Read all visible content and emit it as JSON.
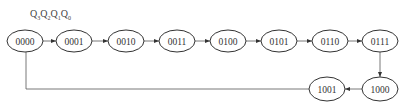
{
  "header": {
    "label_parts": [
      {
        "base": "Q",
        "sub": "3"
      },
      {
        "base": "Q",
        "sub": "2"
      },
      {
        "base": "Q",
        "sub": "1"
      },
      {
        "base": "Q",
        "sub": "0"
      }
    ]
  },
  "states": [
    {
      "label": "0000",
      "cx": 25,
      "cy": 41
    },
    {
      "label": "0001",
      "cx": 74,
      "cy": 41
    },
    {
      "label": "0010",
      "cx": 126,
      "cy": 41
    },
    {
      "label": "0011",
      "cx": 177,
      "cy": 41
    },
    {
      "label": "0100",
      "cx": 228,
      "cy": 41
    },
    {
      "label": "0101",
      "cx": 279,
      "cy": 41
    },
    {
      "label": "0110",
      "cx": 330,
      "cy": 41
    },
    {
      "label": "0111",
      "cx": 380,
      "cy": 41
    },
    {
      "label": "1000",
      "cx": 380,
      "cy": 89
    },
    {
      "label": "1001",
      "cx": 327,
      "cy": 89
    }
  ],
  "transitions": [
    {
      "from": "0000",
      "to": "0001"
    },
    {
      "from": "0001",
      "to": "0010"
    },
    {
      "from": "0010",
      "to": "0011"
    },
    {
      "from": "0011",
      "to": "0100"
    },
    {
      "from": "0100",
      "to": "0101"
    },
    {
      "from": "0101",
      "to": "0110"
    },
    {
      "from": "0110",
      "to": "0111"
    },
    {
      "from": "0111",
      "to": "1000"
    },
    {
      "from": "1000",
      "to": "1001"
    },
    {
      "from": "1001",
      "to": "0000"
    }
  ]
}
